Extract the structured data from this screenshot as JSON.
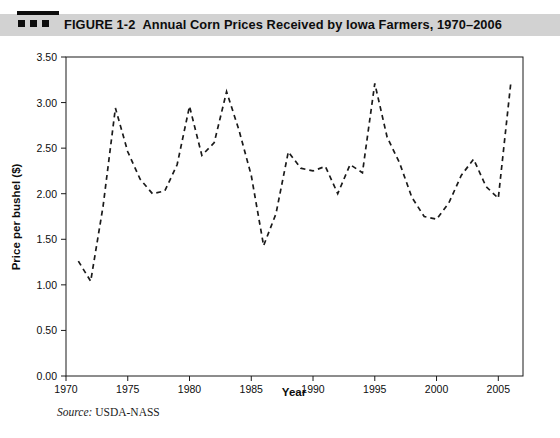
{
  "header": {
    "logo_icon": "figure-marker-icon",
    "figure_number": "FIGURE 1-2",
    "caption": "Annual Corn Prices Received by Iowa Farmers, 1970–2006",
    "band_color": "#d2d2d2"
  },
  "source": {
    "label": "Source:",
    "text": "USDA-NASS"
  },
  "chart_data": {
    "type": "line",
    "title": "Annual Corn Prices Received by Iowa Farmers, 1970–2006",
    "xlabel": "Year",
    "ylabel": "Price per bushel ($)",
    "xlim": [
      1970,
      2007
    ],
    "ylim": [
      0.0,
      3.5
    ],
    "grid": false,
    "legend": null,
    "line_style": "dashed",
    "line_color": "#1a1a1a",
    "xticks": [
      1970,
      1975,
      1980,
      1985,
      1990,
      1995,
      2000,
      2005
    ],
    "xtick_labels": [
      "1970",
      "1975",
      "1980",
      "1985",
      "1990",
      "1995",
      "2000",
      "2005"
    ],
    "yticks": [
      0.0,
      0.5,
      1.0,
      1.5,
      2.0,
      2.5,
      3.0,
      3.5
    ],
    "ytick_labels": [
      "0.00",
      "0.50",
      "1.00",
      "1.50",
      "2.00",
      "2.50",
      "3.00",
      "3.50"
    ],
    "x": [
      1971,
      1972,
      1973,
      1974,
      1975,
      1976,
      1977,
      1978,
      1979,
      1980,
      1981,
      1982,
      1983,
      1984,
      1985,
      1986,
      1987,
      1988,
      1989,
      1990,
      1991,
      1992,
      1993,
      1994,
      1995,
      1996,
      1997,
      1998,
      1999,
      2000,
      2001,
      2002,
      2003,
      2004,
      2005,
      2006
    ],
    "values": [
      1.26,
      1.04,
      1.86,
      2.94,
      2.46,
      2.16,
      2.0,
      2.03,
      2.32,
      2.96,
      2.42,
      2.56,
      3.12,
      2.7,
      2.2,
      1.43,
      1.78,
      2.46,
      2.28,
      2.25,
      2.3,
      2.0,
      2.32,
      2.23,
      3.21,
      2.62,
      2.34,
      1.96,
      1.75,
      1.72,
      1.9,
      2.2,
      2.38,
      2.08,
      1.95,
      3.2
    ],
    "series": [
      {
        "name": "Price per bushel ($)",
        "values": [
          1.26,
          1.04,
          1.86,
          2.94,
          2.46,
          2.16,
          2.0,
          2.03,
          2.32,
          2.96,
          2.42,
          2.56,
          3.12,
          2.7,
          2.2,
          1.43,
          1.78,
          2.46,
          2.28,
          2.25,
          2.3,
          2.0,
          2.32,
          2.23,
          3.21,
          2.62,
          2.34,
          1.96,
          1.75,
          1.72,
          1.9,
          2.2,
          2.38,
          2.08,
          1.95,
          3.2
        ]
      }
    ]
  }
}
